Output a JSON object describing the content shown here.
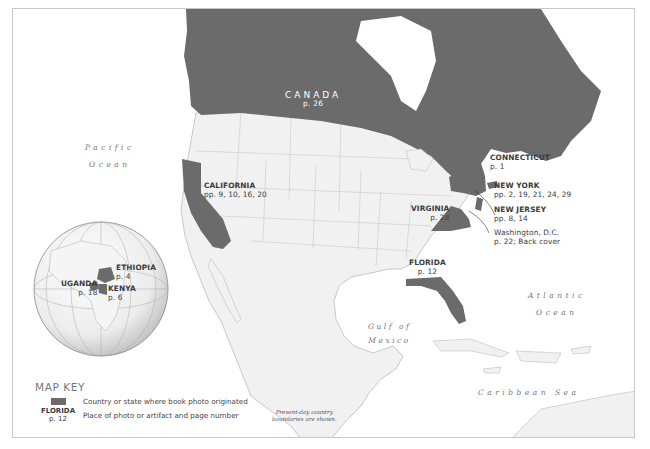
{
  "map": {
    "colors": {
      "highlight": "#6b6b6b",
      "land": "#f1f1f1",
      "border": "#bdbdbd",
      "water": "#ffffff",
      "frame": "#c8c8c8",
      "text": "#3c3c3c"
    },
    "water_labels": {
      "pacific": [
        "Pacific",
        "Ocean"
      ],
      "atlantic": [
        "Atlantic",
        "Ocean"
      ],
      "gulf": [
        "Gulf of",
        "Mexico"
      ],
      "caribbean": "Caribbean Sea"
    },
    "places": {
      "canada": {
        "name": "CANADA",
        "pages": "p. 26"
      },
      "california": {
        "name": "CALIFORNIA",
        "pages": "pp. 9, 10, 16, 20"
      },
      "connecticut": {
        "name": "CONNECTICUT",
        "pages": "p. 1"
      },
      "new_york": {
        "name": "NEW YORK",
        "pages": "pp. 2, 19, 21, 24, 29"
      },
      "new_jersey": {
        "name": "NEW JERSEY",
        "pages": "pp. 8, 14"
      },
      "washington_dc": {
        "name": "Washington, D.C.",
        "pages": "p. 22; Back cover"
      },
      "virginia": {
        "name": "VIRGINIA",
        "pages": "p. 28"
      },
      "florida": {
        "name": "FLORIDA",
        "pages": "p. 12"
      },
      "ethiopia": {
        "name": "ETHIOPIA",
        "pages": "p. 4"
      },
      "uganda": {
        "name": "UGANDA",
        "pages": "p. 18"
      },
      "kenya": {
        "name": "KENYA",
        "pages": "p. 6"
      }
    },
    "key": {
      "title": "MAP KEY",
      "swatch_label": "Country or state where book photo originated",
      "sample_name": "FLORIDA",
      "sample_pages": "p. 12",
      "sample_label": "Place of photo or artifact and page number"
    },
    "note": [
      "Present-day country",
      "boundaries are shown."
    ]
  }
}
